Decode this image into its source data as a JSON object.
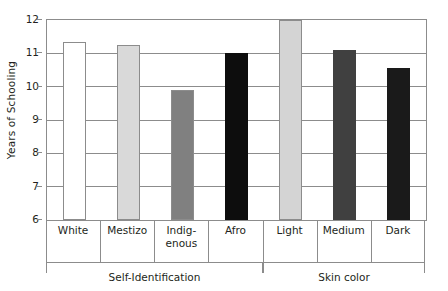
{
  "chart_data": {
    "type": "bar",
    "title": "",
    "xlabel": "",
    "ylabel": "Years of Schooling",
    "ylim": [
      6,
      12
    ],
    "yticks": [
      "6",
      "7",
      "8",
      "9",
      "10",
      "11",
      "12"
    ],
    "grid": true,
    "legend": "none",
    "categories": [
      "White",
      "Mestizo",
      "Indig-\nenous",
      "Afro",
      "Light",
      "Medium",
      "Dark"
    ],
    "values": [
      11.35,
      11.25,
      9.9,
      11.0,
      12.0,
      11.1,
      10.55
    ],
    "bar_colors": [
      "#ffffff",
      "#d9d9d9",
      "#808080",
      "#0d0d0d",
      "#d4d4d4",
      "#404040",
      "#1a1a1a"
    ],
    "bar_edge_colors": [
      "#8c8c8c",
      "#8c8c8c",
      "#8c8c8c",
      "#0d0d0d",
      "#8c8c8c",
      "#404040",
      "#1a1a1a"
    ],
    "groups": [
      {
        "label": "Self-Identification",
        "categories": [
          "White",
          "Mestizo",
          "Indig-\nenous",
          "Afro"
        ]
      },
      {
        "label": "Skin color",
        "categories": [
          "Light",
          "Medium",
          "Dark"
        ]
      }
    ]
  },
  "axis": {
    "y_title": "Years of Schooling",
    "y_tick_6": "6",
    "y_tick_7": "7",
    "y_tick_8": "8",
    "y_tick_9": "9",
    "y_tick_10": "10",
    "y_tick_11": "11",
    "y_tick_12": "12"
  },
  "categories": {
    "c0": "White",
    "c1": "Mestizo",
    "c2": "Indig-\nenous",
    "c3": "Afro",
    "c4": "Light",
    "c5": "Medium",
    "c6": "Dark"
  },
  "groups": {
    "g0": "Self-Identification",
    "g1": "Skin color"
  },
  "colors": {
    "axis": "#8c8c8c",
    "text": "#231f20",
    "background": "#ffffff"
  }
}
